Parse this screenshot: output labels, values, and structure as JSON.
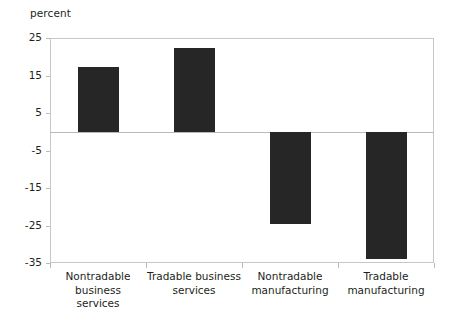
{
  "chart_data": {
    "type": "bar",
    "title": "",
    "subtitle": "",
    "xlabel": "",
    "ylabel": "percent",
    "categories": [
      "Nontradable business\nservices",
      "Tradable business\nservices",
      "Nontradable\nmanufacturing",
      "Tradable\nmanufacturing"
    ],
    "values": [
      17.3,
      22.3,
      -24.5,
      -34.0
    ],
    "ylim": [
      -35,
      25
    ],
    "yticks": [
      25,
      15,
      5,
      -5,
      -15,
      -25,
      -35
    ],
    "ytick_labels": [
      "25",
      "15",
      "5",
      "-5",
      "-15",
      "-25",
      "-35"
    ],
    "grid": false,
    "zero_line": true,
    "legend": "none",
    "bar_color": "#262626",
    "axis_color": "#c6c7c9",
    "text_color": "#231f20"
  }
}
